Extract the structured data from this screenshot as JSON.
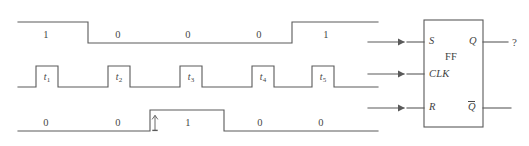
{
  "figure": {
    "type": "digital-timing-diagram-with-flipflop",
    "stroke_color": "#5a5a5a",
    "text_color": "#474747",
    "background": "#ffffff"
  },
  "waveforms": [
    {
      "name": "S",
      "row": "top",
      "bit_labels": [
        "1",
        "0",
        "0",
        "0",
        "1"
      ],
      "levels": [
        1,
        0,
        0,
        0,
        1
      ]
    },
    {
      "name": "CLK",
      "row": "middle",
      "pulse_labels": [
        "t",
        "t",
        "t",
        "t",
        "t"
      ],
      "pulse_subscripts": [
        "1",
        "2",
        "3",
        "4",
        "5"
      ],
      "pulse_count": 5
    },
    {
      "name": "R",
      "row": "bottom",
      "bit_labels": [
        "0",
        "0",
        "1",
        "0",
        "0"
      ],
      "levels": [
        0,
        0,
        1,
        0,
        0
      ],
      "edge_marker": "up-arrow"
    }
  ],
  "flipflop": {
    "body_label": "FF",
    "inputs": [
      {
        "label": "S",
        "name": "s-input"
      },
      {
        "label": "CLK",
        "name": "clk-input"
      },
      {
        "label": "R",
        "name": "r-input"
      }
    ],
    "outputs": [
      {
        "label": "Q",
        "name": "q-output",
        "overbar": false
      },
      {
        "label": "Q",
        "name": "q-bar-output",
        "overbar": true
      }
    ],
    "unknown_marker": "?"
  }
}
